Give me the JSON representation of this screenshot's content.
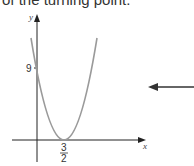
{
  "header": {
    "text": "of the turning point."
  },
  "graph": {
    "x_axis_label": "x",
    "y_axis_label": "y",
    "y_intercept_label": "9",
    "vertex_x_numerator": "3",
    "vertex_x_denominator": "2",
    "curve_color": "#9a9a9a",
    "axis_color": "#222222"
  },
  "pointer_arrow": {
    "direction": "left",
    "color": "#333333"
  }
}
